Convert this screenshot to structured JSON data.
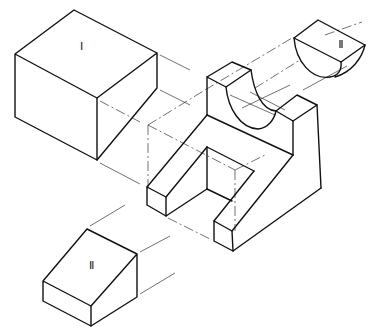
{
  "figure": {
    "type": "exploded isometric technical drawing",
    "stroke_color": "#111111",
    "aux_line_color": "#333333",
    "background": "#ffffff"
  },
  "labels": {
    "part_1": "Ⅰ",
    "part_2": "Ⅱ",
    "part_3": "Ⅲ"
  },
  "parts": [
    {
      "id": "part-I",
      "name": "rectangular block",
      "label": "Ⅰ",
      "visible_edges": [
        "74,10 15,54",
        "74,10 157,53",
        "15,54 97,98",
        "157,53 97,98",
        "15,54 15,117",
        "97,98 97,160",
        "157,53 157,88",
        "15,117 97,160",
        "157,88 97,160"
      ]
    },
    {
      "id": "part-II",
      "name": "wedge block",
      "label": "Ⅱ",
      "visible_edges": [
        "87,229 137,254",
        "87,229 43,281",
        "43,281 91,306",
        "137,254 91,306",
        "43,281 43,301",
        "91,306 91,326",
        "137,254 137,297",
        "43,301 91,326",
        "137,297 91,326"
      ]
    },
    {
      "id": "part-III",
      "name": "half-cylinder block",
      "label": "Ⅲ",
      "visible_edges": [
        "318,20 294,38",
        "318,20 365,45",
        "294,38 341,62",
        "365,45 341,62"
      ]
    },
    {
      "id": "assembled-body",
      "name": "main body with U-slot and semicircular cradle"
    }
  ]
}
